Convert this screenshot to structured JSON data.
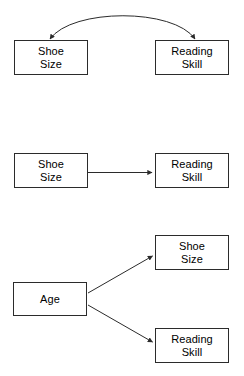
{
  "diagram": {
    "background_color": "#ffffff",
    "stroke_color": "#2b2b2b",
    "text_color": "#000000",
    "width": 244,
    "height": 376,
    "panels": [
      {
        "id": "panel-correlation",
        "caption": "",
        "nodes": [
          {
            "id": "p1-shoe-size",
            "label": "Shoe\nSize",
            "x": 14,
            "y": 40,
            "w": 74,
            "h": 35
          },
          {
            "id": "p1-reading-skill",
            "label": "Reading\nSkill",
            "x": 155,
            "y": 40,
            "w": 74,
            "h": 35
          }
        ],
        "edges": [
          {
            "id": "p1-edge-bidirectional",
            "from": "p1-shoe-size",
            "to": "p1-reading-skill",
            "kind": "curved",
            "arrow_start": true,
            "arrow_end": true,
            "label": ""
          }
        ]
      },
      {
        "id": "panel-direct-cause",
        "caption": "",
        "nodes": [
          {
            "id": "p2-shoe-size",
            "label": "Shoe\nSize",
            "x": 14,
            "y": 153,
            "w": 74,
            "h": 35
          },
          {
            "id": "p2-reading-skill",
            "label": "Reading\nSkill",
            "x": 155,
            "y": 153,
            "w": 74,
            "h": 35
          }
        ],
        "edges": [
          {
            "id": "p2-edge-straight",
            "from": "p2-shoe-size",
            "to": "p2-reading-skill",
            "kind": "straight",
            "arrow_start": false,
            "arrow_end": true,
            "label": ""
          }
        ]
      },
      {
        "id": "panel-common-cause",
        "caption": "",
        "nodes": [
          {
            "id": "p3-age",
            "label": "Age",
            "x": 13,
            "y": 282,
            "w": 74,
            "h": 34
          },
          {
            "id": "p3-shoe-size",
            "label": "Shoe\nSize",
            "x": 155,
            "y": 235,
            "w": 74,
            "h": 35
          },
          {
            "id": "p3-reading-skill",
            "label": "Reading\nSkill",
            "x": 155,
            "y": 328,
            "w": 74,
            "h": 35
          }
        ],
        "edges": [
          {
            "id": "p3-edge-age-to-shoe",
            "from": "p3-age",
            "to": "p3-shoe-size",
            "kind": "diagonal-up",
            "arrow_start": false,
            "arrow_end": true,
            "label": ""
          },
          {
            "id": "p3-edge-age-to-reading",
            "from": "p3-age",
            "to": "p3-reading-skill",
            "kind": "diagonal-down",
            "arrow_start": false,
            "arrow_end": true,
            "label": ""
          }
        ]
      }
    ]
  }
}
